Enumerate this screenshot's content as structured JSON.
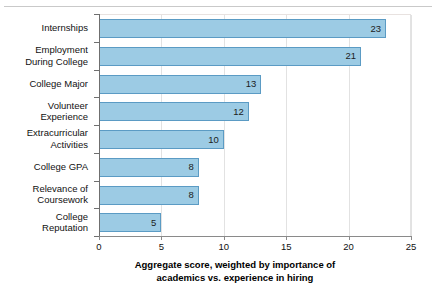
{
  "chart_data": {
    "type": "bar",
    "orientation": "horizontal",
    "title": "",
    "xlabel": "Aggregate score, weighted by importance of academics vs. experience in hiring",
    "xlabel_lines": [
      "Aggregate score, weighted by importance of",
      "academics vs. experience in hiring"
    ],
    "ylabel": "",
    "categories": [
      "Internships",
      "Employment During College",
      "College Major",
      "Volunteer Experience",
      "Extracurricular Activities",
      "College GPA",
      "Relevance of Coursework",
      "College Reputation"
    ],
    "category_lines": [
      [
        "Internships"
      ],
      [
        "Employment",
        "During College"
      ],
      [
        "College Major"
      ],
      [
        "Volunteer",
        "Experience"
      ],
      [
        "Extracurricular",
        "Activities"
      ],
      [
        "College GPA"
      ],
      [
        "Relevance of",
        "Coursework"
      ],
      [
        "College",
        "Reputation"
      ]
    ],
    "values": [
      23,
      21,
      13,
      12,
      10,
      8,
      8,
      5
    ],
    "value_labels": [
      "23",
      "21",
      "13",
      "12",
      "10",
      "8",
      "8",
      "5"
    ],
    "xlim": [
      0,
      25
    ],
    "xticks": [
      0,
      5,
      10,
      15,
      20,
      25
    ],
    "xtick_labels": [
      "0",
      "5",
      "10",
      "15",
      "20",
      "25"
    ],
    "grid": "vertical",
    "legend": "none",
    "colors": {
      "bar_fill": "#9ccbe4",
      "bar_border": "#5b9bc4",
      "gridline": "#e2e2e2",
      "axis": "#6f6f6f",
      "text": "#111111"
    }
  }
}
